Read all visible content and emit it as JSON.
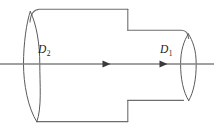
{
  "figure": {
    "name": "stepped-cylinder-diagram",
    "background_color": "#ffffff",
    "outline_color": "#6e6e6e",
    "axis_color": "#808080",
    "arrow_color": "#3a3a3a",
    "label_color": "#1c1c1c"
  },
  "labels": {
    "large_diameter": {
      "symbol": "D",
      "subscript": "2",
      "name": "large-diameter-label"
    },
    "small_diameter": {
      "symbol": "D",
      "subscript": "1",
      "name": "small-diameter-label"
    }
  },
  "geometry": {
    "axis": {
      "y": 64,
      "x_start": 0,
      "x_end": 214
    },
    "arrows": [
      {
        "x": 108,
        "y": 64,
        "direction": "right"
      },
      {
        "x": 165,
        "y": 64,
        "direction": "right"
      }
    ],
    "large_section": {
      "left_face_center_x": 36,
      "top_y": 9,
      "bottom_y": 121,
      "step_x": 128,
      "ellipse_rx": 13,
      "ellipse_ry": 56
    },
    "small_section": {
      "right_face_center_x": 188,
      "top_y": 30,
      "bottom_y": 100,
      "ellipse_rx": 9,
      "ellipse_ry": 35
    }
  }
}
